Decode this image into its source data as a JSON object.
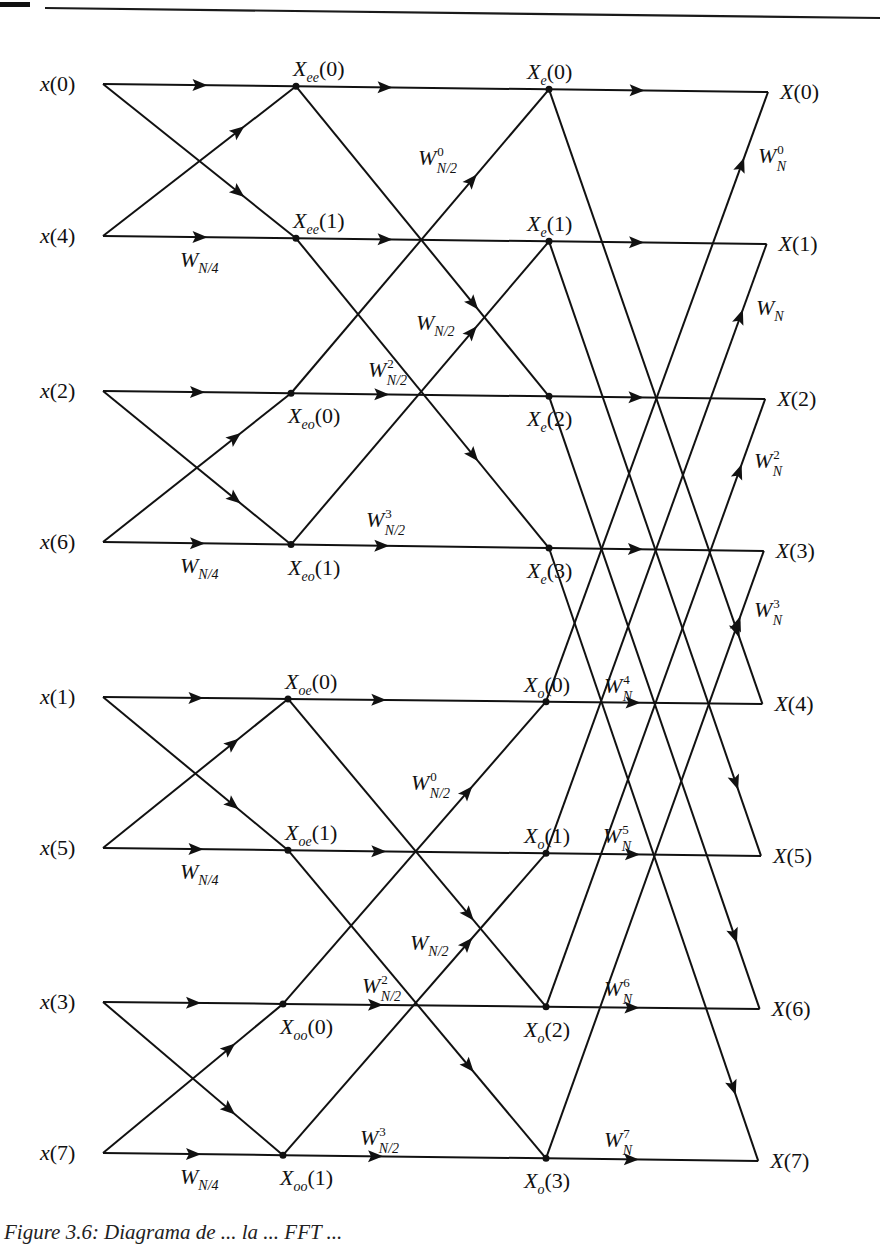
{
  "figure": {
    "caption": "Figure 3.6: Diagrama de ... la ... FFT ...",
    "colors": {
      "ink": "#111111",
      "background": "#ffffff"
    },
    "rule": {
      "x1": 45,
      "y1": 8,
      "x2": 880,
      "y2": 18
    }
  },
  "columns": {
    "input": 103,
    "stage1": 296,
    "stage2": 549,
    "output": 768
  },
  "rows": [
    {
      "index": 0,
      "y_left": 84,
      "y_right": 92
    },
    {
      "index": 1,
      "y_left": 236,
      "y_right": 244
    },
    {
      "index": 2,
      "y_left": 391,
      "y_right": 399
    },
    {
      "index": 3,
      "y_left": 542,
      "y_right": 551
    },
    {
      "index": 4,
      "y_left": 697,
      "y_right": 704
    },
    {
      "index": 5,
      "y_left": 848,
      "y_right": 856
    },
    {
      "index": 6,
      "y_left": 1002,
      "y_right": 1009
    },
    {
      "index": 7,
      "y_left": 1153,
      "y_right": 1161
    }
  ],
  "inputs": [
    {
      "label": "x",
      "arg": "0"
    },
    {
      "label": "x",
      "arg": "4"
    },
    {
      "label": "x",
      "arg": "2"
    },
    {
      "label": "x",
      "arg": "6"
    },
    {
      "label": "x",
      "arg": "1"
    },
    {
      "label": "x",
      "arg": "5"
    },
    {
      "label": "x",
      "arg": "3"
    },
    {
      "label": "x",
      "arg": "7"
    }
  ],
  "outputs": [
    {
      "label": "X",
      "arg": "0"
    },
    {
      "label": "X",
      "arg": "1"
    },
    {
      "label": "X",
      "arg": "2"
    },
    {
      "label": "X",
      "arg": "3"
    },
    {
      "label": "X",
      "arg": "4"
    },
    {
      "label": "X",
      "arg": "5"
    },
    {
      "label": "X",
      "arg": "6"
    },
    {
      "label": "X",
      "arg": "7"
    }
  ],
  "stage1_nodes": [
    {
      "label": "X",
      "sub": "ee",
      "arg": "0",
      "pos": "above"
    },
    {
      "label": "X",
      "sub": "ee",
      "arg": "1",
      "pos": "above"
    },
    {
      "label": "X",
      "sub": "eo",
      "arg": "0",
      "pos": "below"
    },
    {
      "label": "X",
      "sub": "eo",
      "arg": "1",
      "pos": "below"
    },
    {
      "label": "X",
      "sub": "oe",
      "arg": "0",
      "pos": "above"
    },
    {
      "label": "X",
      "sub": "oe",
      "arg": "1",
      "pos": "above"
    },
    {
      "label": "X",
      "sub": "oo",
      "arg": "0",
      "pos": "below"
    },
    {
      "label": "X",
      "sub": "oo",
      "arg": "1",
      "pos": "below"
    }
  ],
  "stage2_nodes": [
    {
      "label": "X",
      "sub": "e",
      "arg": "0",
      "pos": "above"
    },
    {
      "label": "X",
      "sub": "e",
      "arg": "1",
      "pos": "above"
    },
    {
      "label": "X",
      "sub": "e",
      "arg": "2",
      "pos": "below"
    },
    {
      "label": "X",
      "sub": "e",
      "arg": "3",
      "pos": "below"
    },
    {
      "label": "X",
      "sub": "o",
      "arg": "0",
      "pos": "above"
    },
    {
      "label": "X",
      "sub": "o",
      "arg": "1",
      "pos": "above"
    },
    {
      "label": "X",
      "sub": "o",
      "arg": "2",
      "pos": "below"
    },
    {
      "label": "X",
      "sub": "o",
      "arg": "3",
      "pos": "below"
    }
  ],
  "twiddles": {
    "stage1": [
      {
        "row": 1,
        "base": "W",
        "sub": "N/4",
        "sup": ""
      },
      {
        "row": 3,
        "base": "W",
        "sub": "N/4",
        "sup": ""
      },
      {
        "row": 5,
        "base": "W",
        "sub": "N/4",
        "sup": ""
      },
      {
        "row": 7,
        "base": "W",
        "sub": "N/4",
        "sup": ""
      }
    ],
    "stage2": [
      {
        "x": 418,
        "y": 165,
        "base": "W",
        "sub": "N/2",
        "sup": "0"
      },
      {
        "x": 416,
        "y": 330,
        "base": "W",
        "sub": "N/2",
        "sup": ""
      },
      {
        "x": 368,
        "y": 377,
        "base": "W",
        "sub": "N/2",
        "sup": "2"
      },
      {
        "x": 366,
        "y": 527,
        "base": "W",
        "sub": "N/2",
        "sup": "3"
      },
      {
        "x": 411,
        "y": 790,
        "base": "W",
        "sub": "N/2",
        "sup": "0"
      },
      {
        "x": 410,
        "y": 950,
        "base": "W",
        "sub": "N/2",
        "sup": ""
      },
      {
        "x": 362,
        "y": 993,
        "base": "W",
        "sub": "N/2",
        "sup": "2"
      },
      {
        "x": 360,
        "y": 1145,
        "base": "W",
        "sub": "N/2",
        "sup": "3"
      }
    ],
    "stage3": [
      {
        "x": 758,
        "y": 163,
        "base": "W",
        "sub": "N",
        "sup": "0"
      },
      {
        "x": 756,
        "y": 315,
        "base": "W",
        "sub": "N",
        "sup": ""
      },
      {
        "x": 754,
        "y": 468,
        "base": "W",
        "sub": "N",
        "sup": "2"
      },
      {
        "x": 754,
        "y": 617,
        "base": "W",
        "sub": "N",
        "sup": "3"
      },
      {
        "x": 604,
        "y": 693,
        "base": "W",
        "sub": "N",
        "sup": "4"
      },
      {
        "x": 603,
        "y": 843,
        "base": "W",
        "sub": "N",
        "sup": "5"
      },
      {
        "x": 604,
        "y": 996,
        "base": "W",
        "sub": "N",
        "sup": "6"
      },
      {
        "x": 604,
        "y": 1147,
        "base": "W",
        "sub": "N",
        "sup": "7"
      }
    ]
  }
}
